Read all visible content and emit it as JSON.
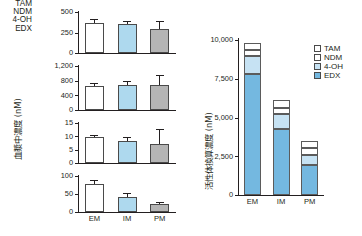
{
  "figure": {
    "background": "#ffffff",
    "colors": {
      "white_bar": "#ffffff",
      "blue_bar": "#aed9ee",
      "gray_bar": "#b5b5b5",
      "edx_blue": "#74b8e0",
      "four_oh_blue": "#c6e2f3",
      "ndm_white": "#ffffff",
      "tam_white": "#ffffff",
      "axis": "#231f20",
      "bar_outline": "#4a4a4a"
    }
  },
  "chart_data": [
    {
      "type": "bar",
      "id": "tam-panel",
      "title": "TAM",
      "ylabel": "血漿中濃度 (nM)",
      "xlabel": "",
      "categories": [
        "EM",
        "IM",
        "PM"
      ],
      "values": [
        370,
        355,
        295
      ],
      "errors": [
        45,
        40,
        90
      ],
      "ylim": [
        0,
        500
      ],
      "yticks": [
        0,
        250,
        500
      ],
      "ytick_labels": [
        "0",
        "250",
        "500"
      ],
      "bar_colors": [
        "#ffffff",
        "#aed9ee",
        "#b5b5b5"
      ],
      "grid": false,
      "legend": "none"
    },
    {
      "type": "bar",
      "id": "ndm-panel",
      "title": "NDM",
      "ylabel": "血漿中濃度 (nM)",
      "xlabel": "",
      "categories": [
        "EM",
        "IM",
        "PM"
      ],
      "values": [
        660,
        695,
        690
      ],
      "errors": [
        75,
        85,
        270
      ],
      "ylim": [
        0,
        1200
      ],
      "yticks": [
        0,
        400,
        800,
        1200
      ],
      "ytick_labels": [
        "0",
        "400",
        "800",
        "1,200"
      ],
      "bar_colors": [
        "#ffffff",
        "#aed9ee",
        "#b5b5b5"
      ],
      "grid": false,
      "legend": "none"
    },
    {
      "type": "bar",
      "id": "four-oh-panel",
      "title": "4-OH",
      "ylabel": "血漿中濃度 (nM)",
      "xlabel": "",
      "categories": [
        "EM",
        "IM",
        "PM"
      ],
      "values": [
        9.6,
        8.2,
        7.3
      ],
      "errors": [
        1.0,
        1.5,
        5.3
      ],
      "ylim": [
        0,
        15
      ],
      "yticks": [
        0,
        5,
        10,
        15
      ],
      "ytick_labels": [
        "0",
        "5",
        "10",
        "15"
      ],
      "bar_colors": [
        "#ffffff",
        "#aed9ee",
        "#b5b5b5"
      ],
      "grid": false,
      "legend": "none"
    },
    {
      "type": "bar",
      "id": "edx-panel",
      "title": "EDX",
      "ylabel": "血漿中濃度 (nM)",
      "xlabel": "",
      "categories": [
        "EM",
        "IM",
        "PM"
      ],
      "values": [
        78,
        42,
        21
      ],
      "errors": [
        11,
        11,
        8
      ],
      "ylim": [
        0,
        100
      ],
      "yticks": [
        0,
        50,
        100
      ],
      "ytick_labels": [
        "0",
        "50",
        "100"
      ],
      "bar_colors": [
        "#ffffff",
        "#aed9ee",
        "#b5b5b5"
      ],
      "grid": false,
      "legend": "none"
    },
    {
      "type": "bar",
      "id": "activity-panel",
      "stacked": true,
      "title": "",
      "ylabel": "活性体換算濃度 (nM)",
      "xlabel": "",
      "categories": [
        "EM",
        "IM",
        "PM"
      ],
      "series": [
        {
          "name": "EDX",
          "values": [
            7800,
            4250,
            1950
          ],
          "color": "#74b8e0"
        },
        {
          "name": "4-OH",
          "values": [
            1150,
            950,
            650
          ],
          "color": "#c6e2f3"
        },
        {
          "name": "NDM",
          "values": [
            420,
            430,
            430
          ],
          "color": "#ffffff"
        },
        {
          "name": "TAM",
          "values": [
            430,
            470,
            470
          ],
          "color": "#ffffff"
        }
      ],
      "totals": [
        9800,
        6100,
        3500
      ],
      "ylim": [
        0,
        10000
      ],
      "yticks": [
        0,
        2500,
        5000,
        7500,
        10000
      ],
      "ytick_labels": [
        "0",
        "2,500",
        "5,000",
        "7,500",
        "10,000"
      ],
      "grid": false,
      "legend_position": "right",
      "legend_entries": [
        {
          "label": "TAM",
          "color": "#ffffff"
        },
        {
          "label": "NDM",
          "color": "#ffffff"
        },
        {
          "label": "4-OH",
          "color": "#c6e2f3"
        },
        {
          "label": "EDX",
          "color": "#74b8e0"
        }
      ]
    }
  ]
}
